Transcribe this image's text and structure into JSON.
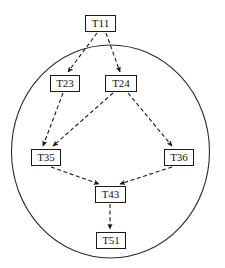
{
  "diagram": {
    "background_color": "#ffffff",
    "stroke_color": "#1a1a1a",
    "node_fill": "#ffffff",
    "edge_style": "dashed",
    "boundary": {
      "name": "enclosing-ellipse",
      "shape": "ellipse",
      "cx": 110.5,
      "cy": 151.5,
      "rx": 99.0,
      "ry": 106.5,
      "stroke": "#2a2a2a",
      "fill": "none"
    },
    "nodes": [
      {
        "id": "T11",
        "label": "T11",
        "x": 85,
        "y": 15,
        "w": 31,
        "h": 17
      },
      {
        "id": "T23",
        "label": "T23",
        "x": 50,
        "y": 75,
        "w": 30,
        "h": 17
      },
      {
        "id": "T24",
        "label": "T24",
        "x": 105,
        "y": 75,
        "w": 32,
        "h": 17
      },
      {
        "id": "T35",
        "label": "T35",
        "x": 31,
        "y": 149,
        "w": 30,
        "h": 17
      },
      {
        "id": "T36",
        "label": "T36",
        "x": 164,
        "y": 149,
        "w": 30,
        "h": 17
      },
      {
        "id": "T43",
        "label": "T43",
        "x": 95,
        "y": 186,
        "w": 31,
        "h": 17
      },
      {
        "id": "T51",
        "label": "T51",
        "x": 96,
        "y": 232,
        "w": 30,
        "h": 17
      }
    ],
    "edges": [
      {
        "from": "T11",
        "to": "T23",
        "x1": 97,
        "y1": 33,
        "x2": 68,
        "y2": 72
      },
      {
        "from": "T11",
        "to": "T24",
        "x1": 106,
        "y1": 33,
        "x2": 120,
        "y2": 72
      },
      {
        "from": "T23",
        "to": "T35",
        "x1": 63,
        "y1": 93,
        "x2": 43,
        "y2": 146
      },
      {
        "from": "T24",
        "to": "T35",
        "x1": 113,
        "y1": 93,
        "x2": 53,
        "y2": 146
      },
      {
        "from": "T24",
        "to": "T36",
        "x1": 128,
        "y1": 93,
        "x2": 172,
        "y2": 146
      },
      {
        "from": "T35",
        "to": "T43",
        "x1": 51,
        "y1": 167,
        "x2": 99,
        "y2": 184
      },
      {
        "from": "T36",
        "to": "T43",
        "x1": 172,
        "y1": 167,
        "x2": 120,
        "y2": 184
      },
      {
        "from": "T43",
        "to": "T51",
        "x1": 110,
        "y1": 204,
        "x2": 110,
        "y2": 229
      }
    ]
  }
}
